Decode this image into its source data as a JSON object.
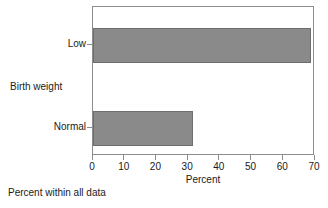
{
  "chart_data": {
    "type": "bar",
    "orientation": "horizontal",
    "title": "",
    "categories": [
      "Low",
      "Normal"
    ],
    "values": [
      68.7,
      31.5
    ],
    "series": [
      {
        "name": "Percent within all data",
        "values": [
          68.7,
          31.5
        ]
      }
    ],
    "xlabel": "Percent",
    "ylabel": "Birth weight",
    "xlim": [
      0,
      70
    ],
    "xticks": [
      0,
      10,
      20,
      30,
      40,
      50,
      60,
      70
    ],
    "xtick_labels": [
      "0",
      "10",
      "20",
      "30",
      "40",
      "50",
      "60",
      "70"
    ],
    "grid": false,
    "legend": false,
    "bar_color": "#8a8a8a",
    "bar_border_color": "#6e6e6e",
    "axis_color": "#8c8c8c",
    "text_color": "#1a1a1a",
    "footnote": "Percent within all data"
  },
  "axes": {
    "y_title": "Birth weight",
    "x_title": "Percent",
    "y_categories": [
      {
        "label": "Low"
      },
      {
        "label": "Normal"
      }
    ],
    "x_ticks": [
      {
        "label": "0"
      },
      {
        "label": "10"
      },
      {
        "label": "20"
      },
      {
        "label": "30"
      },
      {
        "label": "40"
      },
      {
        "label": "50"
      },
      {
        "label": "60"
      },
      {
        "label": "70"
      }
    ]
  },
  "footer": {
    "note": "Percent within all data"
  }
}
